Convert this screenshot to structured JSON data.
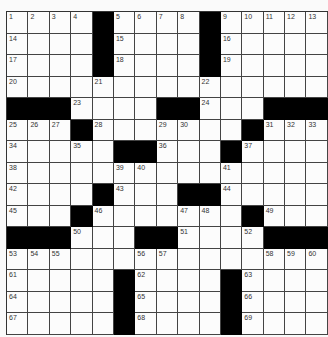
{
  "puzzle": {
    "rows": 15,
    "cols": 15,
    "colors": {
      "block": "#000000",
      "cell": "#fcfcfc",
      "line": "#444444"
    },
    "layout": [
      "....#....#.....",
      "....#....#.....",
      "....#....#.....",
      "...............",
      "###....##...###",
      "...#.......#...",
      ".....##...#....",
      "...............",
      "....#...##.....",
      "...#.......#...",
      "###...##....###",
      "...............",
      ".....#....#....",
      ".....#....#....",
      ".....#....#...."
    ],
    "numbers": [
      [
        1,
        0,
        0
      ],
      [
        2,
        0,
        1
      ],
      [
        3,
        0,
        2
      ],
      [
        4,
        0,
        3
      ],
      [
        5,
        0,
        5
      ],
      [
        6,
        0,
        6
      ],
      [
        7,
        0,
        7
      ],
      [
        8,
        0,
        8
      ],
      [
        9,
        0,
        10
      ],
      [
        10,
        0,
        11
      ],
      [
        11,
        0,
        12
      ],
      [
        12,
        0,
        13
      ],
      [
        13,
        0,
        14
      ],
      [
        14,
        1,
        0
      ],
      [
        15,
        1,
        5
      ],
      [
        16,
        1,
        10
      ],
      [
        17,
        2,
        0
      ],
      [
        18,
        2,
        5
      ],
      [
        19,
        2,
        10
      ],
      [
        20,
        3,
        0
      ],
      [
        21,
        3,
        4
      ],
      [
        22,
        3,
        9
      ],
      [
        23,
        4,
        3
      ],
      [
        24,
        4,
        9
      ],
      [
        25,
        5,
        0
      ],
      [
        26,
        5,
        1
      ],
      [
        27,
        5,
        2
      ],
      [
        28,
        5,
        4
      ],
      [
        29,
        5,
        7
      ],
      [
        30,
        5,
        8
      ],
      [
        31,
        5,
        12
      ],
      [
        32,
        5,
        13
      ],
      [
        33,
        5,
        14
      ],
      [
        34,
        6,
        0
      ],
      [
        35,
        6,
        3
      ],
      [
        36,
        6,
        7
      ],
      [
        37,
        6,
        11
      ],
      [
        38,
        7,
        0
      ],
      [
        39,
        7,
        5
      ],
      [
        40,
        7,
        6
      ],
      [
        41,
        7,
        10
      ],
      [
        42,
        8,
        0
      ],
      [
        43,
        8,
        5
      ],
      [
        44,
        8,
        10
      ],
      [
        45,
        9,
        0
      ],
      [
        46,
        9,
        4
      ],
      [
        47,
        9,
        8
      ],
      [
        48,
        9,
        9
      ],
      [
        49,
        9,
        12
      ],
      [
        50,
        10,
        3
      ],
      [
        51,
        10,
        8
      ],
      [
        52,
        10,
        11
      ],
      [
        53,
        11,
        0
      ],
      [
        54,
        11,
        1
      ],
      [
        55,
        11,
        2
      ],
      [
        56,
        11,
        6
      ],
      [
        57,
        11,
        7
      ],
      [
        58,
        11,
        12
      ],
      [
        59,
        11,
        13
      ],
      [
        60,
        11,
        14
      ],
      [
        61,
        12,
        0
      ],
      [
        62,
        12,
        6
      ],
      [
        63,
        12,
        11
      ],
      [
        64,
        13,
        0
      ],
      [
        65,
        13,
        6
      ],
      [
        66,
        13,
        11
      ],
      [
        67,
        14,
        0
      ],
      [
        68,
        14,
        6
      ],
      [
        69,
        14,
        11
      ]
    ]
  }
}
